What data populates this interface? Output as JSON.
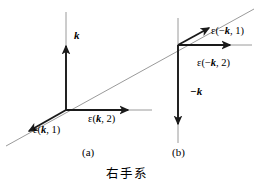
{
  "figure": {
    "caption": "右手系",
    "panels": [
      {
        "id": "a",
        "label": "(a)"
      },
      {
        "id": "b",
        "label": "(b)"
      }
    ],
    "colors": {
      "vector_stroke": "#1a1a1a",
      "axis_line": "#8f8f8f",
      "text": "#000000",
      "background": "#ffffff"
    },
    "panel_a": {
      "origin": {
        "x": 66,
        "y": 110
      },
      "vectors": [
        {
          "name": "k",
          "label_prefix": "",
          "label_symbol": "k",
          "label_suffix": "",
          "direction": "up",
          "tip": {
            "x": 66,
            "y": 45
          }
        },
        {
          "name": "epsilon-k-1",
          "label_prefix": "ε(",
          "label_symbol": "k",
          "label_suffix": ", 1)",
          "direction": "down-left",
          "tip": {
            "x": 28,
            "y": 132
          }
        },
        {
          "name": "epsilon-k-2",
          "label_prefix": "ε(",
          "label_symbol": "k",
          "label_suffix": ", 2)",
          "direction": "right",
          "tip": {
            "x": 128,
            "y": 110
          }
        }
      ]
    },
    "panel_b": {
      "origin": {
        "x": 178,
        "y": 45
      },
      "vectors": [
        {
          "name": "epsilon-minus-k-1",
          "label_prefix": "ε(−",
          "label_symbol": "k",
          "label_suffix": ", 1)",
          "direction": "up-right",
          "tip": {
            "x": 210,
            "y": 27
          }
        },
        {
          "name": "epsilon-minus-k-2",
          "label_prefix": "ε(−",
          "label_symbol": "k",
          "label_suffix": ", 2)",
          "direction": "right",
          "tip": {
            "x": 231,
            "y": 45
          }
        },
        {
          "name": "minus-k",
          "label_prefix": "−",
          "label_symbol": "k",
          "label_suffix": "",
          "direction": "down",
          "tip": {
            "x": 178,
            "y": 125
          }
        }
      ]
    },
    "diagonal_line": {
      "name": "shared-diagonal-axis",
      "from": {
        "x": 6,
        "y": 146
      },
      "to": {
        "x": 254,
        "y": 9
      }
    }
  }
}
